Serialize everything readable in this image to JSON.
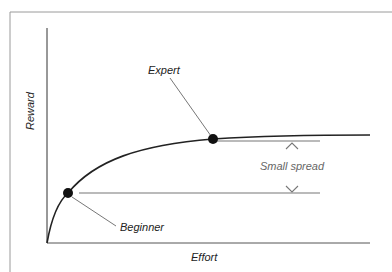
{
  "diagram": {
    "x_axis_label": "Effort",
    "y_axis_label": "Reward",
    "points": [
      {
        "label": "Beginner",
        "x": 68,
        "y": 193
      },
      {
        "label": "Expert",
        "x": 213,
        "y": 139
      }
    ],
    "spread_label": "Small spread",
    "colors": {
      "curve": "#222222",
      "guide_lines": "#777777",
      "frame": "#999999",
      "dots": "#111111"
    }
  }
}
